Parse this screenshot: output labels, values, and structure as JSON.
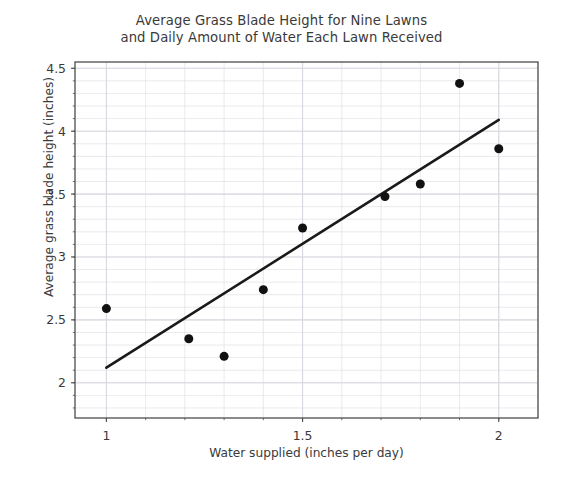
{
  "chart_data": {
    "type": "scatter",
    "title": "Average Grass Blade Height for Nine Lawns\nand Daily Amount of Water Each Lawn Received",
    "xlabel": "Water supplied (inches per day)",
    "ylabel": "Average grass blade height (inches)",
    "xlim": [
      0.92,
      2.1
    ],
    "ylim": [
      1.72,
      4.55
    ],
    "xticks": [
      1,
      1.5,
      2
    ],
    "xtick_labels": [
      "1",
      "1.5",
      "2"
    ],
    "yticks": [
      2,
      2.5,
      3,
      3.5,
      4,
      4.5
    ],
    "ytick_labels": [
      "2",
      "2.5",
      "3",
      "3.5",
      "4",
      "4.5"
    ],
    "x_minor_step": 0.1,
    "y_minor_step": 0.1,
    "grid": true,
    "grid_color": "#d8d8e0",
    "legend": "none",
    "marker_color": "#111111",
    "marker_size": 9,
    "points": [
      {
        "x": 1.0,
        "y": 2.59
      },
      {
        "x": 1.21,
        "y": 2.35
      },
      {
        "x": 1.3,
        "y": 2.21
      },
      {
        "x": 1.4,
        "y": 2.74
      },
      {
        "x": 1.5,
        "y": 3.23
      },
      {
        "x": 1.71,
        "y": 3.48
      },
      {
        "x": 1.8,
        "y": 3.58
      },
      {
        "x": 1.9,
        "y": 4.38
      },
      {
        "x": 2.0,
        "y": 3.86
      }
    ],
    "trendline": {
      "name": "line of best fit",
      "color": "#1a1a1a",
      "width": 2.6,
      "x_start": 1.0,
      "y_start": 2.12,
      "x_end": 2.0,
      "y_end": 4.09
    }
  },
  "axes": {
    "spine_color": "#4d4d4d",
    "tick_color": "#4d4d4d"
  }
}
